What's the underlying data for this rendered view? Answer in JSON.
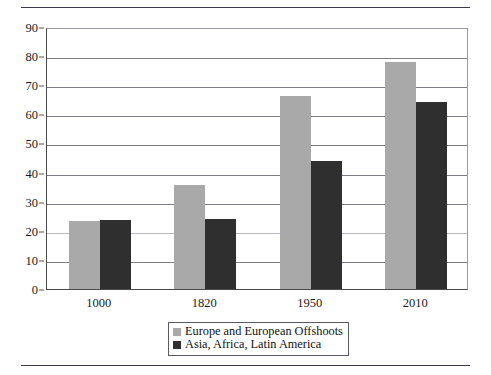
{
  "chart_data": {
    "type": "bar",
    "title": "",
    "subtitle": "",
    "xlabel": "",
    "ylabel": "",
    "categories": [
      "1000",
      "1820",
      "1950",
      "2010"
    ],
    "series": [
      {
        "name": "Europe and European Offshoots",
        "color": "#a9a9a9",
        "values": [
          23.5,
          35.7,
          66.2,
          78.0
        ]
      },
      {
        "name": "Asia, Africa, Latin America",
        "color": "#2f2f2f",
        "values": [
          23.8,
          24.0,
          44.0,
          64.3
        ]
      }
    ],
    "ylim": [
      0,
      90
    ],
    "ytick_step": 10,
    "yticks": [
      0,
      10,
      20,
      30,
      40,
      50,
      60,
      70,
      80,
      90
    ],
    "grid": true,
    "grid_axis": "y",
    "legend_position": "bottom-center",
    "bar_gap_within_group": 0
  },
  "figure": {
    "top_rule": "horizontal-rule",
    "bottom_rule": "horizontal-rule"
  }
}
